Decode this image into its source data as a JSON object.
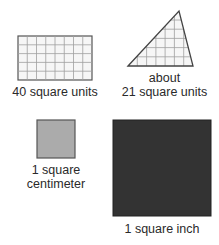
{
  "figures": [
    {
      "id": "rectangle",
      "shape": "grid-rectangle",
      "columns": 8,
      "rows": 5,
      "label_lines": [
        "40 square units"
      ]
    },
    {
      "id": "triangle",
      "shape": "grid-triangle",
      "label_lines": [
        "about",
        "21 square units"
      ]
    },
    {
      "id": "square-centimeter",
      "shape": "square",
      "fill": "#a9a9a9",
      "label_lines": [
        "1 square",
        "centimeter"
      ]
    },
    {
      "id": "square-inch",
      "shape": "square",
      "fill": "#333333",
      "label_lines": [
        "1 square inch"
      ]
    }
  ],
  "colors": {
    "grid_line": "#9a9a9a",
    "outline": "#444444",
    "grid_fill": "#f4f4f4",
    "text": "#2a2a2a"
  }
}
